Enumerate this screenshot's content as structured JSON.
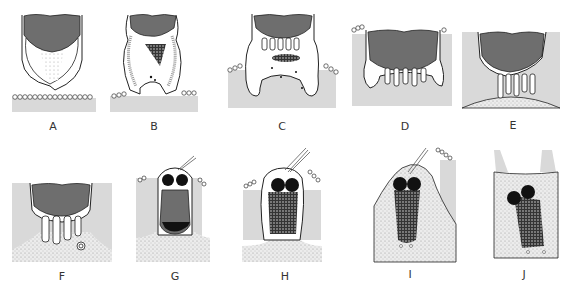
{
  "figure": {
    "panels": [
      {
        "id": "A",
        "label": "A",
        "lx": 53,
        "ly": 120
      },
      {
        "id": "B",
        "label": "B",
        "lx": 154,
        "ly": 120
      },
      {
        "id": "C",
        "label": "C",
        "lx": 282,
        "ly": 120
      },
      {
        "id": "D",
        "label": "D",
        "lx": 405,
        "ly": 120
      },
      {
        "id": "E",
        "label": "E",
        "lx": 513,
        "ly": 119
      },
      {
        "id": "F",
        "label": "F",
        "lx": 62,
        "ly": 270
      },
      {
        "id": "G",
        "label": "G",
        "lx": 175,
        "ly": 270
      },
      {
        "id": "H",
        "label": "H",
        "lx": 285,
        "ly": 270
      },
      {
        "id": "I",
        "label": "I",
        "lx": 410,
        "ly": 268
      },
      {
        "id": "J",
        "label": "J",
        "lx": 524,
        "ly": 268
      }
    ],
    "colors": {
      "nucleus_gray": "#6e6e6e",
      "cytoplasm_gray": "#d9d9d9",
      "outline": "#222222",
      "chromatin": "#111111"
    }
  }
}
